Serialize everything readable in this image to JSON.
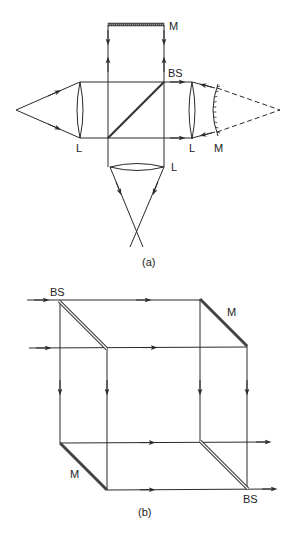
{
  "figure_a": {
    "caption": "(a)",
    "labels": {
      "top_mirror": "M",
      "beam_splitter": "BS",
      "left_lens": "L",
      "right_lens": "L",
      "curved_mirror": "M",
      "bottom_lens": "L"
    }
  },
  "figure_b": {
    "caption": "(b)",
    "labels": {
      "beam_splitter_top": "BS",
      "mirror_top": "M",
      "mirror_bottom": "M",
      "beam_splitter_bottom": "BS"
    }
  },
  "colors": {
    "line": "#2a2a2a",
    "mirror": "#444444",
    "background": "#ffffff"
  }
}
